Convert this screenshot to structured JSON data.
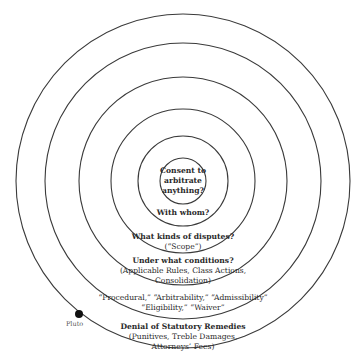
{
  "diagram": {
    "type": "concentric-circles",
    "line_color": "#3a3a3a",
    "center": [
      183,
      181
    ],
    "radii": [
      23,
      45,
      72,
      104,
      138,
      167
    ],
    "rings": [
      {
        "title": "Consent to arbitrate anything?",
        "lines": [
          "Consent to",
          "arbitrate",
          "anything?"
        ]
      },
      {
        "title": "With whom?"
      },
      {
        "title": "What kinds of disputes?",
        "detail": "(“Scope”)"
      },
      {
        "title": "Under what conditions?",
        "detail_lines": [
          "(Applicable Rules, Class Actions,",
          "Consolidation)"
        ]
      },
      {
        "title": "",
        "detail_lines": [
          "“Procedural,” “Arbitrability,” “Admissibility”",
          "“Eligibility,” “Waiver”"
        ]
      },
      {
        "title": "Denial of Statutory Remedies",
        "detail_lines": [
          "(Punitives, Treble Damages,",
          "Attorneys’ Fees)"
        ]
      }
    ],
    "marker": {
      "label": "Pluto",
      "x": 79,
      "y": 314,
      "r": 4,
      "color": "#111111"
    }
  }
}
